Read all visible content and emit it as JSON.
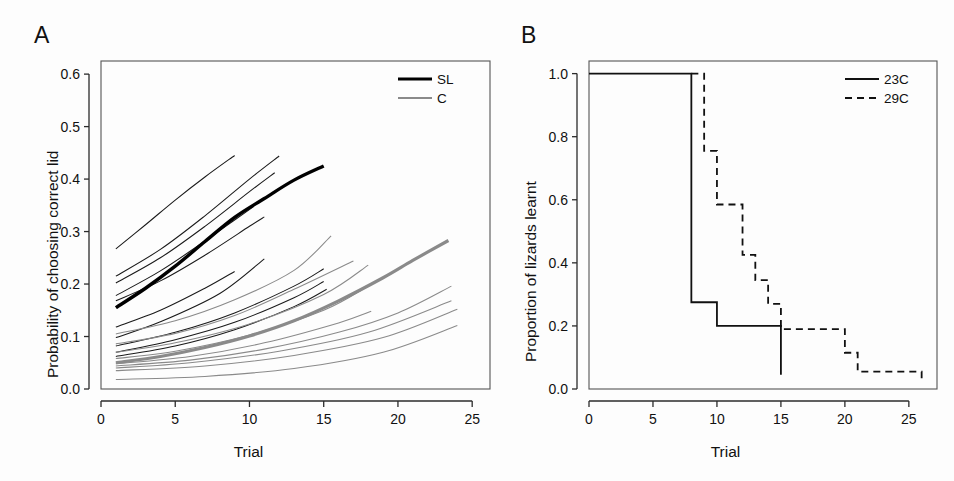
{
  "figure": {
    "background": "#fdfdfd",
    "panels": [
      "A",
      "B"
    ]
  },
  "panelA": {
    "label": "A",
    "xlabel": "Trial",
    "ylabel": "Probability of choosing correct lid",
    "xticks": [
      "0",
      "5",
      "10",
      "15",
      "20",
      "25"
    ],
    "yticks": [
      "0.0",
      "0.1",
      "0.2",
      "0.3",
      "0.4",
      "0.5",
      "0.6"
    ],
    "legend": [
      {
        "label": "SL",
        "color": "#000000",
        "width": 3.2,
        "dash": "none"
      },
      {
        "label": "C",
        "color": "#8a8a8a",
        "width": 2.0,
        "dash": "none"
      }
    ]
  },
  "panelB": {
    "label": "B",
    "xlabel": "Trial",
    "ylabel": "Proportion of lizards learnt",
    "xticks": [
      "0",
      "5",
      "10",
      "15",
      "20",
      "25"
    ],
    "yticks": [
      "0.0",
      "0.2",
      "0.4",
      "0.6",
      "0.8",
      "1.0"
    ],
    "legend": [
      {
        "label": "23C",
        "color": "#111111",
        "width": 1.8,
        "dash": "none"
      },
      {
        "label": "29C",
        "color": "#111111",
        "width": 1.8,
        "dash": "7,5"
      }
    ]
  },
  "chart_data": [
    {
      "type": "line",
      "panel": "A",
      "title": "",
      "xlabel": "Trial",
      "ylabel": "Probability of choosing correct lid",
      "xlim": [
        0,
        26.2
      ],
      "ylim": [
        0.0,
        0.625
      ],
      "xticks": [
        0,
        5,
        10,
        15,
        20,
        25
      ],
      "yticks": [
        0.0,
        0.1,
        0.2,
        0.3,
        0.4,
        0.5,
        0.6
      ],
      "grid": false,
      "legend_position": "top-right",
      "legend": [
        "SL",
        "C"
      ],
      "note": "Logistic learning curves; thick lines are group means, thin lines are individual lizards",
      "series": [
        {
          "name": "SL mean",
          "group": "SL",
          "role": "mean",
          "color": "#000000",
          "x": [
            1,
            3,
            5,
            7,
            9,
            11,
            13,
            15
          ],
          "y": [
            0.155,
            0.192,
            0.234,
            0.281,
            0.327,
            0.363,
            0.398,
            0.425
          ]
        },
        {
          "name": "C mean",
          "group": "C",
          "role": "mean",
          "color": "#8a8a8a",
          "x": [
            1,
            4,
            7,
            10,
            13,
            16,
            19,
            21,
            23.4
          ],
          "y": [
            0.05,
            0.062,
            0.079,
            0.101,
            0.13,
            0.168,
            0.212,
            0.245,
            0.283
          ]
        },
        {
          "name": "SL ind 1",
          "group": "SL",
          "role": "individual",
          "color": "#1a1a1a",
          "x": [
            1,
            3,
            5,
            7,
            9
          ],
          "y": [
            0.267,
            0.313,
            0.36,
            0.404,
            0.445
          ]
        },
        {
          "name": "SL ind 2",
          "group": "SL",
          "role": "individual",
          "color": "#1a1a1a",
          "x": [
            1,
            4,
            7,
            10,
            12
          ],
          "y": [
            0.215,
            0.266,
            0.33,
            0.4,
            0.444
          ]
        },
        {
          "name": "SL ind 3",
          "group": "SL",
          "role": "individual",
          "color": "#1a1a1a",
          "x": [
            1,
            4,
            7,
            10,
            11.7
          ],
          "y": [
            0.202,
            0.25,
            0.31,
            0.376,
            0.412
          ]
        },
        {
          "name": "SL ind 4",
          "group": "SL",
          "role": "individual",
          "color": "#1a1a1a",
          "x": [
            1,
            4,
            7,
            9,
            10.3
          ],
          "y": [
            0.178,
            0.225,
            0.282,
            0.322,
            0.348
          ]
        },
        {
          "name": "SL ind 5",
          "group": "SL",
          "role": "individual",
          "color": "#1a1a1a",
          "x": [
            1,
            4,
            7,
            10,
            11
          ],
          "y": [
            0.168,
            0.206,
            0.255,
            0.31,
            0.328
          ]
        },
        {
          "name": "SL ind 6",
          "group": "SL",
          "role": "individual",
          "color": "#1a1a1a",
          "x": [
            1,
            4,
            7,
            9
          ],
          "y": [
            0.118,
            0.15,
            0.192,
            0.224
          ]
        },
        {
          "name": "SL ind 7",
          "group": "SL",
          "role": "individual",
          "color": "#1a1a1a",
          "x": [
            1,
            4,
            8,
            11
          ],
          "y": [
            0.098,
            0.128,
            0.182,
            0.248
          ]
        },
        {
          "name": "SL ind 8",
          "group": "SL",
          "role": "individual",
          "color": "#1a1a1a",
          "x": [
            1,
            5,
            9,
            13,
            15
          ],
          "y": [
            0.082,
            0.108,
            0.145,
            0.196,
            0.229
          ]
        },
        {
          "name": "SL ind 9",
          "group": "SL",
          "role": "individual",
          "color": "#1a1a1a",
          "x": [
            1,
            5,
            9,
            13,
            15
          ],
          "y": [
            0.07,
            0.094,
            0.127,
            0.174,
            0.205
          ]
        },
        {
          "name": "SL ind 10",
          "group": "SL",
          "role": "individual",
          "color": "#1a1a1a",
          "x": [
            1,
            5,
            9,
            13,
            15.2
          ],
          "y": [
            0.062,
            0.082,
            0.113,
            0.157,
            0.19
          ]
        },
        {
          "name": "C ind 1",
          "group": "C",
          "role": "individual",
          "color": "#8a8a8a",
          "x": [
            1,
            5,
            9,
            13,
            15.5
          ],
          "y": [
            0.105,
            0.13,
            0.17,
            0.226,
            0.292
          ]
        },
        {
          "name": "C ind 2",
          "group": "C",
          "role": "individual",
          "color": "#8a8a8a",
          "x": [
            1,
            5,
            9,
            13,
            17
          ],
          "y": [
            0.086,
            0.106,
            0.14,
            0.19,
            0.244
          ]
        },
        {
          "name": "C ind 3",
          "group": "C",
          "role": "individual",
          "color": "#8a8a8a",
          "x": [
            1,
            5,
            10,
            15,
            18
          ],
          "y": [
            0.07,
            0.088,
            0.124,
            0.18,
            0.236
          ]
        },
        {
          "name": "C ind 4",
          "group": "C",
          "role": "individual",
          "color": "#8a8a8a",
          "x": [
            1,
            5,
            10,
            15,
            18
          ],
          "y": [
            0.058,
            0.072,
            0.103,
            0.15,
            0.196
          ]
        },
        {
          "name": "C ind 5",
          "group": "C",
          "role": "individual",
          "color": "#8a8a8a",
          "x": [
            1,
            6,
            11,
            16,
            18.2
          ],
          "y": [
            0.048,
            0.062,
            0.088,
            0.126,
            0.148
          ]
        },
        {
          "name": "C ind 6",
          "group": "C",
          "role": "individual",
          "color": "#8a8a8a",
          "x": [
            1,
            6,
            11,
            16,
            20,
            23.6
          ],
          "y": [
            0.044,
            0.055,
            0.076,
            0.108,
            0.145,
            0.196
          ]
        },
        {
          "name": "C ind 7",
          "group": "C",
          "role": "individual",
          "color": "#8a8a8a",
          "x": [
            1,
            6,
            12,
            18,
            23.6
          ],
          "y": [
            0.04,
            0.05,
            0.072,
            0.108,
            0.168
          ]
        },
        {
          "name": "C ind 8",
          "group": "C",
          "role": "individual",
          "color": "#8a8a8a",
          "x": [
            1,
            7,
            13,
            19,
            24
          ],
          "y": [
            0.035,
            0.044,
            0.064,
            0.098,
            0.152
          ]
        },
        {
          "name": "C ind 9",
          "group": "C",
          "role": "individual",
          "color": "#8a8a8a",
          "x": [
            1,
            7,
            13,
            19,
            24
          ],
          "y": [
            0.018,
            0.024,
            0.039,
            0.07,
            0.121
          ]
        }
      ]
    },
    {
      "type": "line",
      "panel": "B",
      "title": "",
      "xlabel": "Trial",
      "ylabel": "Proportion of lizards learnt",
      "xlim": [
        0,
        27.2
      ],
      "ylim": [
        0.0,
        1.04
      ],
      "xticks": [
        0,
        5,
        10,
        15,
        20,
        25
      ],
      "yticks": [
        0.0,
        0.2,
        0.4,
        0.6,
        0.8,
        1.0
      ],
      "grid": false,
      "legend_position": "top-right",
      "legend": [
        "23C",
        "29C"
      ],
      "note": "Kaplan-Meier style step (survival) curves with terminal censor tick at trial 15 for 23C",
      "series": [
        {
          "name": "23C",
          "style": "step",
          "dash": "none",
          "color": "#111111",
          "x": [
            0,
            8,
            8,
            10,
            10,
            15,
            15
          ],
          "y": [
            1.0,
            1.0,
            0.275,
            0.275,
            0.2,
            0.2,
            0.045
          ]
        },
        {
          "name": "29C",
          "style": "step",
          "dash": "dashed",
          "color": "#111111",
          "x": [
            8,
            9,
            9,
            10,
            10,
            12,
            12,
            13,
            13,
            14,
            14,
            15,
            15,
            20,
            20,
            21,
            21,
            26,
            26
          ],
          "y": [
            1.0,
            1.0,
            0.755,
            0.755,
            0.585,
            0.585,
            0.425,
            0.425,
            0.345,
            0.345,
            0.27,
            0.27,
            0.19,
            0.19,
            0.115,
            0.115,
            0.055,
            0.055,
            0.02
          ]
        }
      ]
    }
  ]
}
